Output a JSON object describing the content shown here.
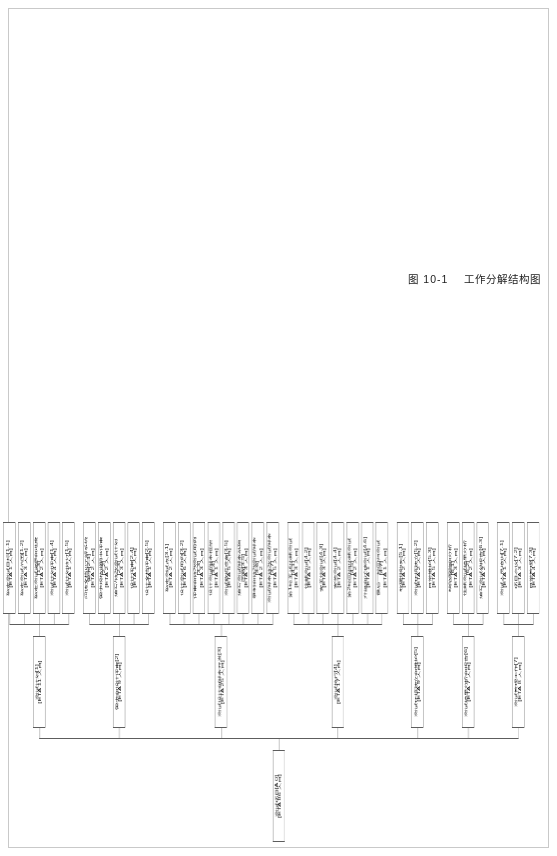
{
  "figure": {
    "caption_number": "图 10-1",
    "caption_title": "工作分解结构图"
  },
  "root": {
    "label": "测试项目[A 0]",
    "eta": "[ETA 86 人日]"
  },
  "branches": [
    {
      "label": "测试计划[1]",
      "eta": "[ETA 11 人日]",
      "children": [
        {
          "label": "确定测试目标[1.1]",
          "eta": "[ETA 1 人日]"
        },
        {
          "label": "确定测试范围[1.2]",
          "eta": "[ETA 3 人日]"
        },
        {
          "label": "确定测试资源和进度",
          "code": "[1.3]",
          "eta": "[ETA 2 人日]"
        },
        {
          "label": "测试计划评审[1.4]",
          "eta": "[ETA 4 人日]"
        },
        {
          "label": "测试计划修订[1.5]",
          "eta": "[ETA 1 人日]"
        }
      ]
    },
    {
      "label": "需求和设计评审[2]",
      "eta": "[ETA 9 人日]",
      "children": [
        {
          "label": "阅读文档以了解系统",
          "code": "需求[2.1]",
          "eta": "[ETA 2 人日]"
        },
        {
          "label": "需求规格说明书评审",
          "code": "[2.2]",
          "eta": "[ETA 2 人日]"
        },
        {
          "label": "编写/修改测试计划",
          "code": "[2.3]",
          "eta": "[ETA 3 人日]"
        },
        {
          "label": "设计评审[2.4]",
          "eta": "[ETA 1 人日]"
        },
        {
          "label": "设计文档评审[2.5]",
          "eta": "[ETA 1 人日]"
        }
      ]
    },
    {
      "label": "测试设计和脚本开发[3]",
      "eta": "[ETA 25 人日]",
      "children": [
        {
          "label": "确定测试点[3.1]",
          "eta": "[ETA 2 人日]"
        },
        {
          "label": "设计测试用例[3.2]",
          "eta": "[ETA 6 人日]"
        },
        {
          "label": "评审和修改测试用例",
          "code": "[3.3]",
          "eta": "[ETA 3 人日]"
        },
        {
          "label": "设计测试脚本框架",
          "code": "[3.4]",
          "eta": "[ETA 1 人日]"
        },
        {
          "label": "测试数据准备[3.5]",
          "eta": "[ETA 5 人日]"
        },
        {
          "label": "编写测试脚本基础",
          "code": "函数[3.5]",
          "eta": "[ETA 3 人日]"
        },
        {
          "label": "录制和修改测试脚本",
          "code": "[3.6]",
          "eta": "[ETA 2 人日]"
        },
        {
          "label": "测试脚本修改测试脚本",
          "code": "[3.7]",
          "eta": "[ETA 5 人日]"
        }
      ]
    },
    {
      "label": "测试执行[4]",
      "eta": "[ETA 17 人日]",
      "children": [
        {
          "label": "第1轮全新功能测试",
          "code": "[4.1]",
          "eta": "[ETA 3 人日]"
        },
        {
          "label": "性能测试[4.2]",
          "eta": "[ETA 5 人日]"
        },
        {
          "label": "安全性测试[4.3]",
          "eta": "[ETA 3 人日]"
        },
        {
          "label": "安装测试[4.4]",
          "eta": "[ETA 2 人日]"
        },
        {
          "label": "第2轮回归功能测试",
          "code": "[4.5]",
          "eta": "[ETA 2 人日]"
        },
        {
          "label": "升级和迁移测试[4.6]",
          "eta": "[ETA 1 人日]"
        },
        {
          "label": "最后一轮回归测试",
          "code": "[4.7]",
          "eta": "[ETA 1 人日]"
        }
      ]
    },
    {
      "label": "测试环境建立和维护[5]",
      "eta": "[ETA 9 人日]",
      "children": [
        {
          "label": "软硬件购买[5.1]",
          "eta": "[ETA 2 人日]"
        },
        {
          "label": "测试环境建立[5.2]",
          "eta": "[ETA 2 人日]"
        },
        {
          "label": "日常维护[5.3]",
          "eta": "[ETA 5 人日]"
        }
      ]
    },
    {
      "label": "测试结果分析和报告[6]",
      "eta": "[ETA 7 人日]",
      "children": [
        {
          "label": "缺陷跟踪和分析",
          "code": "[6.1]",
          "eta": "[ETA 3 人日]"
        },
        {
          "label": "性能测试结果分析",
          "code": "[6.2]",
          "eta": "[ETA 2 人日]"
        },
        {
          "label": "编写测试总报告[6.3]",
          "eta": "[ETA 2 人日]"
        }
      ]
    },
    {
      "label": "测试管理工作[7]",
      "eta": "[ETA 8 人日]",
      "children": [
        {
          "label": "测试人员培训[7.1]",
          "eta": "[ETA 1 人日]"
        },
        {
          "label": "项目会议[7.2]",
          "eta": "[ETA 3 人日]"
        },
        {
          "label": "日常管理[7.3]",
          "eta": "[ETA 4 人日]"
        }
      ]
    }
  ]
}
